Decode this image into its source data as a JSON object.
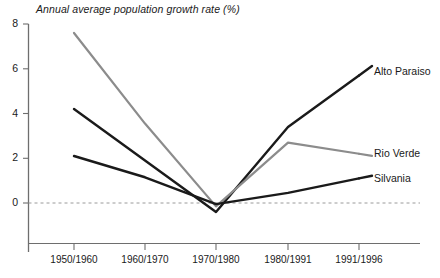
{
  "chart_data": {
    "type": "line",
    "title": "Annual average population growth rate (%)",
    "xlabel": "",
    "ylabel": "",
    "categories": [
      "1950/1960",
      "1960/1970",
      "1970/1980",
      "1980/1991",
      "1991/1996"
    ],
    "ylim": [
      -1.2,
      8
    ],
    "yticks": [
      0,
      2,
      4,
      6,
      8
    ],
    "ytick_labels": [
      "0",
      "2",
      "4",
      "6",
      "8"
    ],
    "grid": false,
    "zero_line": true,
    "legend_position": "right-inline",
    "series": [
      {
        "name": "Alto Paraiso",
        "values": [
          4.2,
          1.9,
          -0.4,
          3.4,
          5.7
        ],
        "color": "#1a1a1a",
        "width": 2.4
      },
      {
        "name": "Rio Verde",
        "values": [
          7.6,
          3.55,
          -0.15,
          2.7,
          2.2
        ],
        "color": "#8c8c8c",
        "width": 2.2
      },
      {
        "name": "Silvania",
        "values": [
          2.1,
          1.15,
          -0.05,
          0.45,
          1.1
        ],
        "color": "#1a1a1a",
        "width": 2.4
      }
    ]
  },
  "axis": {
    "y_label_0": "0",
    "y_label_2": "2",
    "y_label_4": "4",
    "y_label_6": "6",
    "y_label_8": "8",
    "x_label_0": "1950/1960",
    "x_label_1": "1960/1970",
    "x_label_2": "1970/1980",
    "x_label_3": "1980/1991",
    "x_label_4": "1991/1996"
  },
  "legend": {
    "alto_paraiso": "Alto Paraiso",
    "rio_verde": "Rio Verde",
    "silvania": "Silvania"
  }
}
